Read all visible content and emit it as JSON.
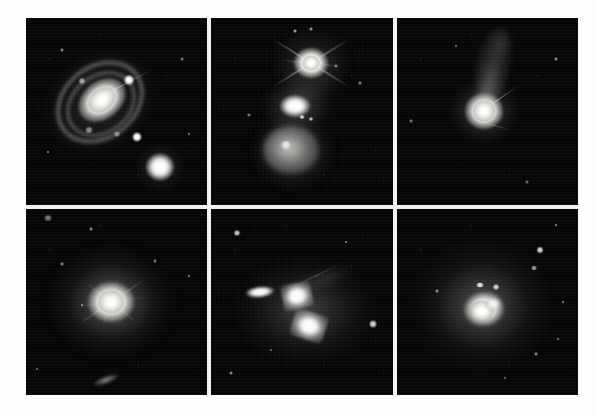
{
  "figure": {
    "kind": "astronomical-image-montage",
    "layout": {
      "rows": 2,
      "columns": 3
    },
    "background_color": "#ffffff",
    "gutter_color": "#f2f2f0",
    "sky_color": "#050507",
    "source_color": "#ffffff"
  },
  "panels": [
    {
      "id": "panel-1",
      "position": "top-left",
      "caption": "",
      "objects": [
        {
          "name": "barred-spiral-host-galaxy",
          "kind": "galaxy",
          "brightness": "very-bright",
          "position_pct": [
            42,
            44
          ]
        },
        {
          "name": "spiral-ring-structure",
          "kind": "ring",
          "brightness": "faint",
          "position_pct": [
            41,
            45
          ]
        },
        {
          "name": "companion-galaxy",
          "kind": "galaxy",
          "brightness": "bright",
          "position_pct": [
            74,
            80
          ]
        },
        {
          "name": "foreground-star-upper",
          "kind": "star",
          "brightness": "bright",
          "position_pct": [
            57,
            33
          ]
        },
        {
          "name": "foreground-star-lower",
          "kind": "star",
          "brightness": "bright",
          "position_pct": [
            61,
            64
          ]
        },
        {
          "name": "diffraction-spike",
          "kind": "spike",
          "brightness": "faint",
          "position_pct": [
            52,
            37
          ]
        }
      ]
    },
    {
      "id": "panel-2",
      "position": "top-middle",
      "caption": "",
      "objects": [
        {
          "name": "bright-nucleus-north",
          "kind": "quasar-nucleus",
          "brightness": "very-bright",
          "position_pct": [
            55,
            24
          ]
        },
        {
          "name": "diffraction-spikes-north",
          "kind": "spike",
          "brightness": "bright",
          "position_pct": [
            55,
            24
          ]
        },
        {
          "name": "intermediate-knot",
          "kind": "knot",
          "brightness": "bright",
          "position_pct": [
            46,
            47
          ]
        },
        {
          "name": "companion-galaxy-south",
          "kind": "galaxy",
          "brightness": "moderate",
          "position_pct": [
            45,
            72
          ]
        },
        {
          "name": "tidal-bridge",
          "kind": "filament",
          "brightness": "faint",
          "position_pct": [
            50,
            45
          ]
        }
      ]
    },
    {
      "id": "panel-3",
      "position": "top-right",
      "caption": "",
      "objects": [
        {
          "name": "compact-nucleus",
          "kind": "quasar-nucleus",
          "brightness": "very-bright",
          "position_pct": [
            48,
            50
          ]
        },
        {
          "name": "tidal-plume",
          "kind": "plume",
          "brightness": "faint",
          "position_pct": [
            53,
            26
          ]
        },
        {
          "name": "diffraction-spike",
          "kind": "spike",
          "brightness": "moderate",
          "position_pct": [
            56,
            44
          ]
        }
      ]
    },
    {
      "id": "panel-4",
      "position": "bottom-left",
      "caption": "",
      "objects": [
        {
          "name": "bright-nucleus",
          "kind": "quasar-nucleus",
          "brightness": "very-bright",
          "position_pct": [
            47,
            50
          ]
        },
        {
          "name": "extended-halo",
          "kind": "halo",
          "brightness": "moderate",
          "position_pct": [
            47,
            50
          ]
        },
        {
          "name": "radial-diffraction-spikes",
          "kind": "spike",
          "brightness": "moderate",
          "position_pct": [
            47,
            50
          ]
        },
        {
          "name": "edge-on-background-galaxy",
          "kind": "galaxy",
          "brightness": "faint",
          "position_pct": [
            44,
            92
          ]
        },
        {
          "name": "field-star-upper-left",
          "kind": "star",
          "brightness": "faint",
          "position_pct": [
            12,
            5
          ]
        }
      ]
    },
    {
      "id": "panel-5",
      "position": "bottom-middle",
      "caption": "",
      "objects": [
        {
          "name": "merger-knot-north",
          "kind": "knot",
          "brightness": "very-bright",
          "position_pct": [
            47,
            47
          ]
        },
        {
          "name": "merger-knot-south",
          "kind": "knot",
          "brightness": "very-bright",
          "position_pct": [
            54,
            62
          ]
        },
        {
          "name": "elongated-companion",
          "kind": "galaxy",
          "brightness": "bright",
          "position_pct": [
            27,
            45
          ]
        },
        {
          "name": "tidal-tail",
          "kind": "filament",
          "brightness": "faint",
          "position_pct": [
            62,
            38
          ]
        },
        {
          "name": "field-star-right",
          "kind": "star",
          "brightness": "moderate",
          "position_pct": [
            89,
            62
          ]
        },
        {
          "name": "field-star-upper-left",
          "kind": "star",
          "brightness": "moderate",
          "position_pct": [
            14,
            13
          ]
        }
      ]
    },
    {
      "id": "panel-6",
      "position": "bottom-right",
      "caption": "",
      "objects": [
        {
          "name": "irregular-host-galaxy",
          "kind": "galaxy",
          "brightness": "very-bright",
          "position_pct": [
            48,
            54
          ]
        },
        {
          "name": "diffuse-envelope",
          "kind": "halo",
          "brightness": "moderate",
          "position_pct": [
            47,
            52
          ]
        },
        {
          "name": "knot-north",
          "kind": "knot",
          "brightness": "bright",
          "position_pct": [
            46,
            41
          ]
        },
        {
          "name": "knot-northeast",
          "kind": "knot",
          "brightness": "bright",
          "position_pct": [
            55,
            42
          ]
        },
        {
          "name": "field-star-upper-right",
          "kind": "star",
          "brightness": "moderate",
          "position_pct": [
            79,
            22
          ]
        },
        {
          "name": "field-star-right",
          "kind": "star",
          "brightness": "faint",
          "position_pct": [
            76,
            32
          ]
        },
        {
          "name": "field-star-lower-right",
          "kind": "star",
          "brightness": "faint",
          "position_pct": [
            77,
            78
          ]
        }
      ]
    }
  ]
}
